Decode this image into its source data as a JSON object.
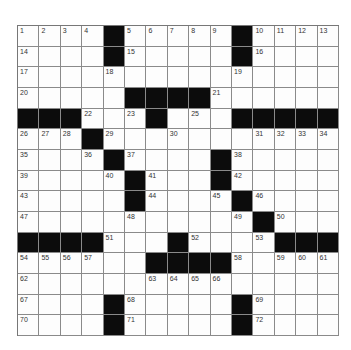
{
  "puzzle": {
    "rows": 15,
    "cols": 15,
    "colors": {
      "block": "#0c0c0c",
      "cell": "#fdfdfd",
      "line": "#8a8a8a",
      "number": "#333333"
    },
    "layout": [
      "....#.....#....",
      "....#.....#....",
      "...............",
      ".....####......",
      "###...#...#####",
      "...#...........",
      "....#....#.....",
      ".....#...#.....",
      ".....#....#....",
      "...........#...",
      "####...#....###",
      "......####.....",
      "...............",
      "....#.....#....",
      "....#.....#...."
    ],
    "numbers": {
      "0,0": "1",
      "0,1": "2",
      "0,2": "3",
      "0,3": "4",
      "0,5": "5",
      "0,6": "6",
      "0,7": "7",
      "0,8": "8",
      "0,9": "9",
      "0,11": "10",
      "0,12": "11",
      "0,13": "12",
      "0,14": "13",
      "1,0": "14",
      "1,5": "15",
      "1,11": "16",
      "2,0": "17",
      "2,4": "18",
      "2,10": "19",
      "3,0": "20",
      "3,9": "21",
      "4,3": "22",
      "4,5": "23",
      "4,6": "24",
      "4,8": "25",
      "5,0": "26",
      "5,1": "27",
      "5,2": "28",
      "5,4": "29",
      "5,7": "30",
      "5,11": "31",
      "5,12": "32",
      "5,13": "33",
      "5,14": "34",
      "6,0": "35",
      "6,3": "36",
      "6,5": "37",
      "6,10": "38",
      "7,0": "39",
      "7,4": "40",
      "7,6": "41",
      "7,10": "42",
      "8,0": "43",
      "8,6": "44",
      "8,9": "45",
      "8,11": "46",
      "9,0": "47",
      "9,5": "48",
      "9,10": "49",
      "9,12": "50",
      "10,4": "51",
      "10,8": "52",
      "10,11": "53",
      "11,0": "54",
      "11,1": "55",
      "11,2": "56",
      "11,3": "57",
      "11,10": "58",
      "11,12": "59",
      "11,13": "60",
      "11,14": "61",
      "12,0": "62",
      "12,6": "63",
      "12,7": "64",
      "12,8": "65",
      "12,9": "66",
      "13,0": "67",
      "13,5": "68",
      "13,11": "69",
      "14,0": "70",
      "14,5": "71",
      "14,11": "72"
    }
  }
}
